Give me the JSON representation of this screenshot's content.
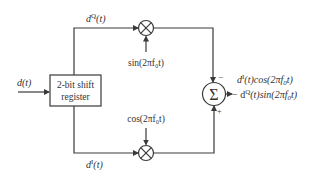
{
  "diagram": {
    "type": "block-diagram",
    "title": "",
    "input": {
      "label": "d(t)"
    },
    "register": {
      "line1": "2-bit shift",
      "line2": "register"
    },
    "branches": {
      "quadrature": {
        "label_base": "d",
        "label_sup": "Q",
        "label_arg": "(t)"
      },
      "inphase": {
        "label_base": "d",
        "label_sup": "I",
        "label_arg": "(t)"
      }
    },
    "multipliers": {
      "top": {
        "symbol": "⊗",
        "carrier": "sin(2πf₀t)"
      },
      "bottom": {
        "symbol": "⊗",
        "carrier": "cos(2πf₀t)"
      }
    },
    "summer": {
      "symbol": "Σ",
      "top_sign": "−",
      "bottom_sign": "+"
    },
    "output": {
      "line1": "d I(t)cos(2πf₀t)",
      "line2": "− d Q(t)sin(2πf₀t)"
    },
    "colors": {
      "stroke": "#3a3a3a",
      "text": "#333333"
    }
  }
}
